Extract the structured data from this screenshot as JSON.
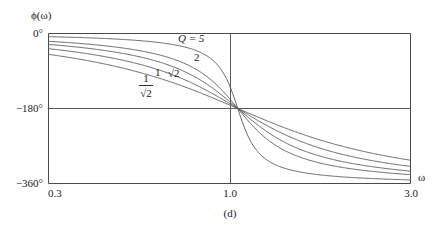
{
  "figure": {
    "caption": "(d)",
    "y_axis_label": "ϕ(ω)",
    "x_axis_label": "ω"
  },
  "axes": {
    "y_ticks": [
      "0°",
      "−180°",
      "−360°"
    ],
    "x_ticks": [
      "0.3",
      "1.0",
      "3.0"
    ]
  },
  "curve_labels": {
    "q5": "Q = 5",
    "q2": "2",
    "qsqrt2": "√2",
    "q1": "1",
    "qinvsqrt2_num": "1",
    "qinvsqrt2_den": "√2"
  },
  "chart_data": {
    "type": "line",
    "title": "",
    "subtitle": "",
    "xlabel": "ω",
    "ylabel": "ϕ(ω)",
    "xscale": "log",
    "xlim": [
      0.3,
      3.0
    ],
    "ylim": [
      -360,
      0
    ],
    "xticks": [
      0.3,
      1.0,
      3.0
    ],
    "xticklabels": [
      "0.3",
      "1.0",
      "3.0"
    ],
    "yticks": [
      0,
      -180,
      -360
    ],
    "yticklabels": [
      "0°",
      "−180°",
      "−360°"
    ],
    "grid": true,
    "grid_lines": [
      "y = -180° horizontal",
      "x = 1.0 vertical"
    ],
    "legend": "inline curve annotations",
    "annotations": [
      {
        "text": "Q = 5",
        "x": 0.74,
        "y": -28
      },
      {
        "text": "2",
        "x": 0.64,
        "y": -68
      },
      {
        "text": "√2",
        "x": 0.565,
        "y": -100
      },
      {
        "text": "1",
        "x": 0.5,
        "y": -102
      },
      {
        "text": "1/√2",
        "x": 0.445,
        "y": -120
      }
    ],
    "formula": "phi(w) = -2*atan( (w/Q) / (1 - w^2) ), unwrapped from 0 to -360 degrees",
    "series": [
      {
        "name": "Q = 5",
        "Q": 5,
        "x": [
          0.3,
          0.4,
          0.5,
          0.6,
          0.7,
          0.8,
          0.9,
          0.95,
          1.0,
          1.05,
          1.1,
          1.2,
          1.4,
          1.7,
          2.0,
          2.5,
          3.0
        ],
        "values": [
          -7.5,
          -10.5,
          -15.2,
          -21.7,
          -31.3,
          -48.1,
          -84.9,
          -124.8,
          -180,
          -235.2,
          -275.1,
          -311.9,
          -337.1,
          -350.4,
          -355.4,
          -359.0,
          -360.8
        ]
      },
      {
        "name": "2",
        "Q": 2,
        "x": [
          0.3,
          0.4,
          0.5,
          0.6,
          0.7,
          0.8,
          0.9,
          0.95,
          1.0,
          1.05,
          1.1,
          1.2,
          1.4,
          1.7,
          2.0,
          2.5,
          3.0
        ],
        "values": [
          -18.6,
          -26.0,
          -37.2,
          -52.0,
          -72.3,
          -99.5,
          -133.1,
          -155.0,
          -180,
          -205.0,
          -226.9,
          -260.5,
          -287.7,
          -308.0,
          -318.0,
          -330.0,
          -337.0
        ]
      },
      {
        "name": "√2",
        "Q": 1.4142,
        "x": [
          0.3,
          0.4,
          0.5,
          0.6,
          0.7,
          0.8,
          0.9,
          0.95,
          1.0,
          1.05,
          1.1,
          1.2,
          1.4,
          1.7,
          2.0,
          2.5,
          3.0
        ],
        "values": [
          -26.1,
          -36.1,
          -50.6,
          -68.9,
          -92.0,
          -118.6,
          -147.0,
          -163.6,
          -180,
          -196.4,
          -213.0,
          -241.4,
          -268.0,
          -291.0,
          -302.9,
          -317.9,
          -326.5
        ]
      },
      {
        "name": "1",
        "Q": 1,
        "x": [
          0.3,
          0.4,
          0.5,
          0.6,
          0.7,
          0.8,
          0.9,
          0.95,
          1.0,
          1.05,
          1.1,
          1.2,
          1.4,
          1.7,
          2.0,
          2.5,
          3.0
        ],
        "values": [
          -36.1,
          -49.0,
          -67.0,
          -88.0,
          -111.6,
          -136.4,
          -159.0,
          -170.0,
          -180,
          -190.0,
          -201.0,
          -224.0,
          -248.9,
          -271.2,
          -284.0,
          -301.0,
          -311.1
        ]
      },
      {
        "name": "1/√2",
        "Q": 0.7071,
        "x": [
          0.3,
          0.4,
          0.5,
          0.6,
          0.7,
          0.8,
          0.9,
          0.95,
          1.0,
          1.05,
          1.1,
          1.2,
          1.4,
          1.7,
          2.0,
          2.5,
          3.0
        ],
        "values": [
          -50.4,
          -67.1,
          -88.0,
          -110.0,
          -131.0,
          -149.3,
          -165.2,
          -172.8,
          -180,
          -187.2,
          -194.0,
          -207.9,
          -228.3,
          -249.0,
          -261.9,
          -281.0,
          -293.5
        ]
      }
    ]
  }
}
